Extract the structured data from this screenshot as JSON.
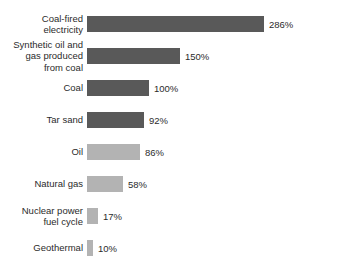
{
  "chart_data": {
    "type": "bar",
    "orientation": "horizontal",
    "title": "",
    "subtitle": "",
    "xlabel": "",
    "ylabel": "",
    "grid": false,
    "legend": false,
    "legend_position": "none",
    "axis_visible": false,
    "value_suffix": "%",
    "xlim": [
      0,
      286
    ],
    "px_per_100_percent": 62,
    "bar_origin_x_px": 91,
    "categories": [
      "Coal-fired\nelectricity",
      "Synthetic oil and\ngas produced\nfrom coal",
      "Coal",
      "Tar sand",
      "Oil",
      "Natural gas",
      "Nuclear power\nfuel cycle",
      "Geothermal"
    ],
    "values": [
      286,
      150,
      100,
      92,
      86,
      58,
      17,
      10
    ],
    "value_labels": [
      "286%",
      "150%",
      "100%",
      "92%",
      "86%",
      "58%",
      "17%",
      "10%"
    ],
    "bar_shades": [
      "dark",
      "dark",
      "dark",
      "dark",
      "light",
      "light",
      "light",
      "light"
    ]
  },
  "colors": {
    "bar_dark": "#595959",
    "bar_light": "#b3b3b3",
    "text": "#2b2b2b",
    "background": "#ffffff"
  },
  "bars": [
    {
      "label": "Coal-fired\nelectricity",
      "value_label": "286%",
      "width_px": "177px",
      "shade": ""
    },
    {
      "label": "Synthetic oil and\ngas produced\nfrom coal",
      "value_label": "150%",
      "width_px": "93px",
      "shade": ""
    },
    {
      "label": "Coal",
      "value_label": "100%",
      "width_px": "62px",
      "shade": ""
    },
    {
      "label": "Tar sand",
      "value_label": "92%",
      "width_px": "57px",
      "shade": ""
    },
    {
      "label": "Oil",
      "value_label": "86%",
      "width_px": "53px",
      "shade": "light"
    },
    {
      "label": "Natural gas",
      "value_label": "58%",
      "width_px": "36px",
      "shade": "light"
    },
    {
      "label": "Nuclear power\nfuel cycle",
      "value_label": "17%",
      "width_px": "11px",
      "shade": "light"
    },
    {
      "label": "Geothermal",
      "value_label": "10%",
      "width_px": "6px",
      "shade": "light"
    }
  ]
}
